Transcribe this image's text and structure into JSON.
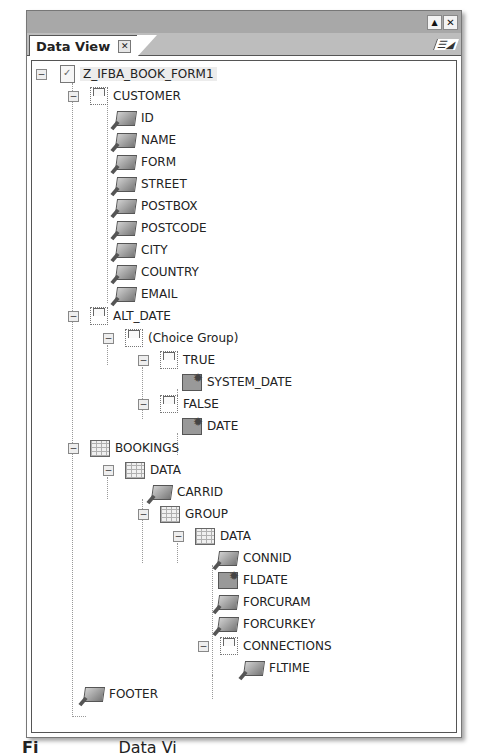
{
  "window": {
    "title_buttons": [
      {
        "name": "maximize",
        "glyph": "▲"
      },
      {
        "name": "close",
        "glyph": "✕"
      }
    ]
  },
  "tab": {
    "label": "Data View",
    "close_glyph": "✕",
    "view_menu_glyph": "☰◢"
  },
  "tree": {
    "root": {
      "label": "Z_IFBA_BOOK_FORM1",
      "icon": "form-doc-icon"
    },
    "customer": {
      "label": "CUSTOMER",
      "icon": "structure-node-icon"
    },
    "customer_fields": [
      "ID",
      "NAME",
      "FORM",
      "STREET",
      "POSTBOX",
      "POSTCODE",
      "CITY",
      "COUNTRY",
      "EMAIL"
    ],
    "alt_date": {
      "label": "ALT_DATE",
      "icon": "structure-node-icon"
    },
    "choice_group": {
      "label": "(Choice Group)",
      "icon": "choice-group-icon"
    },
    "true_node": {
      "label": "TRUE",
      "icon": "structure-node-icon"
    },
    "system_date": {
      "label": "SYSTEM_DATE",
      "icon": "date-field-icon"
    },
    "false_node": {
      "label": "FALSE",
      "icon": "structure-node-icon"
    },
    "date": {
      "label": "DATE",
      "icon": "date-field-icon"
    },
    "bookings": {
      "label": "BOOKINGS",
      "icon": "table-icon"
    },
    "bookings_data": {
      "label": "DATA",
      "icon": "table-row-icon"
    },
    "carrid": {
      "label": "CARRID",
      "icon": "text-field-icon"
    },
    "group": {
      "label": "GROUP",
      "icon": "table-icon"
    },
    "group_data": {
      "label": "DATA",
      "icon": "table-row-icon"
    },
    "connid": {
      "label": "CONNID",
      "icon": "text-field-icon"
    },
    "fldate": {
      "label": "FLDATE",
      "icon": "date-field-icon"
    },
    "forcuram": {
      "label": "FORCURAM",
      "icon": "numeric-field-icon"
    },
    "forcurkey": {
      "label": "FORCURKEY",
      "icon": "text-field-icon"
    },
    "connections": {
      "label": "CONNECTIONS",
      "icon": "structure-node-icon"
    },
    "fltime": {
      "label": "FLTIME",
      "icon": "numeric-field-icon"
    },
    "footer": {
      "label": "FOOTER",
      "icon": "text-field-icon"
    },
    "expander_glyph": "−"
  },
  "caption": {
    "prefix": "Fi",
    "suffix": "Data Vi"
  }
}
